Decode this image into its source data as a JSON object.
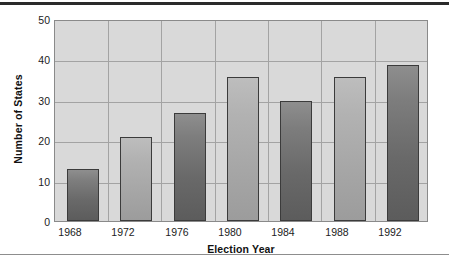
{
  "chart_data": {
    "type": "bar",
    "title": "",
    "subtitle": "",
    "xlabel": "Election Year",
    "ylabel": "Number of States",
    "categories": [
      "1968",
      "1972",
      "1976",
      "1980",
      "1984",
      "1988",
      "1992"
    ],
    "values": [
      13,
      21,
      27,
      36,
      30,
      36,
      39
    ],
    "series": [
      {
        "name": "Number of States",
        "values": [
          13,
          21,
          27,
          36,
          30,
          36,
          39
        ]
      }
    ],
    "ylim": [
      0,
      50
    ],
    "yticks": [
      0,
      10,
      20,
      30,
      40,
      50
    ],
    "ytick_labels": [
      "0",
      "10",
      "20",
      "30",
      "40",
      "50"
    ],
    "xtick_labels": [
      "1968",
      "1972",
      "1976",
      "1980",
      "1984",
      "1988",
      "1992"
    ],
    "grid": true,
    "grid_axis": "both",
    "legend": false,
    "legend_position": "none",
    "annotations": [],
    "bar_styles": [
      "dark",
      "light",
      "dark",
      "light",
      "dark",
      "light",
      "dark"
    ],
    "colors": {
      "bar_dark": "#696969",
      "bar_light": "#a6a6a6",
      "bar_border": "#3b3b3b",
      "plot_background": "#d9d9d9",
      "gridline": "#a3a3a3",
      "frame_border": "#8a8a8a",
      "text": "#1c1c1c",
      "page_background": "#ffffff",
      "top_rule": "#2a2a2a",
      "bottom_rule": "#8d8d8d"
    }
  }
}
